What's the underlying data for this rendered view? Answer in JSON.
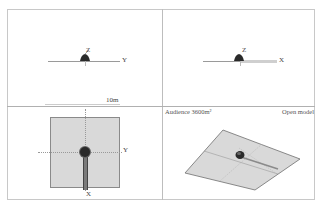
{
  "viewports": {
    "side_yz": {
      "axis_h_label": "Y",
      "axis_v_label": "Z"
    },
    "side_xz": {
      "axis_h_label": "X",
      "axis_v_label": "Z"
    },
    "top_xy": {
      "scale_label": "10m",
      "axis_h_label": "Y",
      "axis_v_label": "X"
    },
    "perspective": {
      "audience_label": "Audience 3600m²",
      "open_model_label": "Open model"
    }
  },
  "colors": {
    "plane_fill": "#d9d9d9",
    "plane_edge": "#7a7a7a",
    "object_dark": "#2a2a2a",
    "divider": "#b0b0b0"
  }
}
